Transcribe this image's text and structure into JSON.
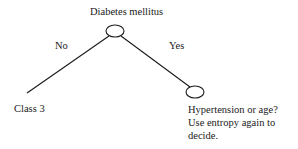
{
  "diagram": {
    "type": "decision-tree",
    "root": {
      "label": "Diabetes mellitus"
    },
    "edges": [
      {
        "label": "No",
        "to": "Class 3"
      },
      {
        "label": "Yes",
        "to": "Hypertension or age? Use entropy again to decide."
      }
    ],
    "leaf_left": {
      "label": "Class 3"
    },
    "node_right": {
      "lines": [
        "Hypertension or age?",
        "Use entropy again to",
        "decide."
      ]
    }
  }
}
